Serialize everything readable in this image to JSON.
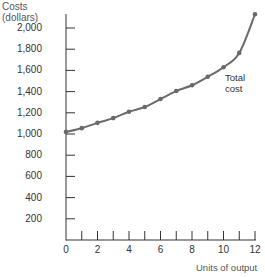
{
  "chart_data": {
    "type": "line",
    "title": "",
    "ylabel": "Costs\n(dollars)",
    "ylabel_lines": [
      "Costs",
      "(dollars)"
    ],
    "xlabel": "Units of output",
    "x": [
      0,
      1,
      2,
      3,
      4,
      5,
      6,
      7,
      8,
      9,
      10,
      11,
      12
    ],
    "series": [
      {
        "name": "Total cost",
        "values": [
          1020,
          1055,
          1105,
          1150,
          1210,
          1255,
          1330,
          1405,
          1460,
          1540,
          1630,
          1765,
          2130
        ]
      }
    ],
    "xlim": [
      0,
      12
    ],
    "ylim": [
      0,
      2200
    ],
    "x_tick_labels": [
      "0",
      "2",
      "4",
      "6",
      "8",
      "10",
      "12"
    ],
    "y_tick_labels": [
      "200",
      "400",
      "600",
      "800",
      "1,000",
      "1,200",
      "1,400",
      "1,600",
      "1,800",
      "2,000"
    ],
    "grid": false,
    "legend": "inline label near curve",
    "colors": {
      "line": "#6a6a6a",
      "axis": "#333333"
    }
  }
}
